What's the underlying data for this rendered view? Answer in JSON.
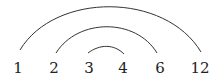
{
  "diagram": {
    "type": "arc-diagram",
    "nodes": [
      {
        "label": "1",
        "x": 18
      },
      {
        "label": "2",
        "x": 54
      },
      {
        "label": "3",
        "x": 89
      },
      {
        "label": "4",
        "x": 123
      },
      {
        "label": "6",
        "x": 160
      },
      {
        "label": "12",
        "x": 200
      }
    ],
    "arcs": [
      {
        "from": "1",
        "to": "12"
      },
      {
        "from": "2",
        "to": "6"
      },
      {
        "from": "3",
        "to": "4"
      }
    ],
    "colors": {
      "stroke": "#333333",
      "text": "#222222",
      "background": "#ffffff"
    }
  }
}
